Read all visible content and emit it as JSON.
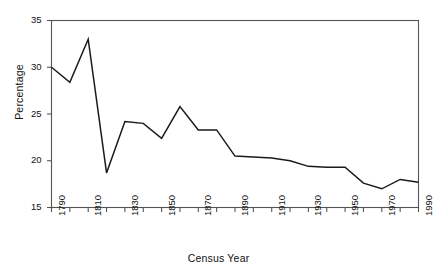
{
  "chart_data": {
    "type": "line",
    "title": "",
    "xlabel": "Census Year",
    "ylabel": "Percentage",
    "x": [
      1790,
      1800,
      1810,
      1820,
      1830,
      1840,
      1850,
      1860,
      1870,
      1880,
      1890,
      1900,
      1910,
      1920,
      1930,
      1940,
      1950,
      1960,
      1970,
      1980,
      1990
    ],
    "values": [
      30.0,
      28.4,
      33.0,
      18.7,
      24.2,
      24.0,
      22.4,
      25.8,
      23.3,
      23.3,
      20.5,
      20.4,
      20.3,
      20.0,
      19.4,
      19.3,
      19.3,
      17.6,
      17.0,
      18.0,
      17.7
    ],
    "series": [
      {
        "name": "Percentage",
        "values": [
          30.0,
          28.4,
          33.0,
          18.7,
          24.2,
          24.0,
          22.4,
          25.8,
          23.3,
          23.3,
          20.5,
          20.4,
          20.3,
          20.0,
          19.4,
          19.3,
          19.3,
          17.6,
          17.0,
          18.0,
          17.7
        ]
      }
    ],
    "xlim": [
      1790,
      1990
    ],
    "ylim": [
      15,
      35
    ],
    "ytick_values": [
      15,
      20,
      25,
      30,
      35
    ],
    "ytick_labels": [
      "15",
      "20",
      "25",
      "30",
      "35"
    ],
    "xtick_values": [
      1790,
      1800,
      1810,
      1820,
      1830,
      1840,
      1850,
      1860,
      1870,
      1880,
      1890,
      1900,
      1910,
      1920,
      1930,
      1940,
      1950,
      1960,
      1970,
      1980,
      1990
    ],
    "xtick_labels": [
      "1790",
      "",
      "1810",
      "",
      "1830",
      "",
      "1850",
      "",
      "1870",
      "",
      "1890",
      "",
      "1910",
      "",
      "1930",
      "",
      "1950",
      "",
      "1970",
      "",
      "1990"
    ],
    "grid": false,
    "legend": null,
    "line_color": "#1a1a1a",
    "frame_color": "#555555",
    "background": "#ffffff"
  }
}
